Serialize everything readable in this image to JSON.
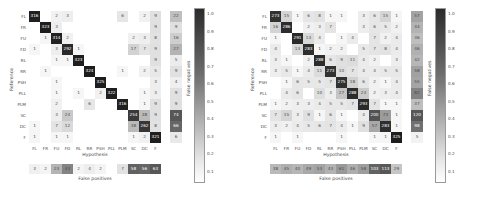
{
  "figure": {
    "panel_count": 2,
    "axis_labels": {
      "x": "Hypothesis",
      "y": "Reference",
      "false_negatives": "False negatives",
      "false_positives": "False positives"
    },
    "colorbar": {
      "ticks": [
        "1.0",
        "0.9",
        "0.8",
        "0.7",
        "0.6",
        "0.5",
        "0.4",
        "0.3",
        "0.2",
        "0.1"
      ],
      "vmin": 0.1,
      "vmax": 1.0,
      "colormap": "greys",
      "low_color": "#ffffff",
      "high_color": "#2b2b2b"
    }
  },
  "chart_data": [
    {
      "type": "heatmap",
      "title": "",
      "panel": "left",
      "xlabel": "Hypothesis",
      "ylabel": "Reference",
      "categories": [
        "FL",
        "FR",
        "FU",
        "FD",
        "RL",
        "RR",
        "PSH",
        "PLL",
        "PLM",
        "SC",
        "DC",
        "F"
      ],
      "row_labels": [
        "FL",
        "FR",
        "FU",
        "FD",
        "RL",
        "RR",
        "PSH",
        "PLL",
        "PLM",
        "SC",
        "DC",
        "F"
      ],
      "col_labels": [
        "FL",
        "FR",
        "FU",
        "FD",
        "RL",
        "RR",
        "PSH",
        "PLL",
        "PLM",
        "SC",
        "DC",
        "F"
      ],
      "values": [
        [
          316,
          0,
          2,
          3,
          0,
          0,
          0,
          0,
          6,
          0,
          2,
          9
        ],
        [
          0,
          323,
          3,
          0,
          0,
          0,
          0,
          0,
          0,
          0,
          0,
          9
        ],
        [
          0,
          1,
          314,
          2,
          0,
          0,
          0,
          0,
          0,
          2,
          3,
          8
        ],
        [
          1,
          0,
          3,
          292,
          1,
          0,
          0,
          0,
          0,
          17,
          7,
          9
        ],
        [
          0,
          0,
          1,
          1,
          323,
          0,
          0,
          0,
          0,
          0,
          0,
          9
        ],
        [
          0,
          1,
          0,
          0,
          0,
          324,
          0,
          0,
          1,
          0,
          2,
          5
        ],
        [
          0,
          0,
          1,
          0,
          0,
          0,
          325,
          0,
          0,
          0,
          0,
          3
        ],
        [
          0,
          0,
          1,
          0,
          1,
          0,
          2,
          322,
          0,
          0,
          1,
          3
        ],
        [
          0,
          0,
          2,
          0,
          0,
          6,
          0,
          0,
          316,
          0,
          1,
          9
        ],
        [
          0,
          0,
          3,
          24,
          0,
          0,
          0,
          0,
          0,
          254,
          38,
          9
        ],
        [
          1,
          0,
          7,
          12,
          0,
          0,
          0,
          0,
          0,
          38,
          262,
          8
        ],
        [
          1,
          0,
          1,
          1,
          0,
          0,
          0,
          0,
          0,
          1,
          2,
          321
        ]
      ],
      "false_negatives": [
        22,
        9,
        16,
        27,
        5,
        9,
        4,
        9,
        9,
        74,
        66,
        6
      ],
      "false_positives": [
        3,
        2,
        23,
        43,
        2,
        4,
        2,
        0,
        7,
        58,
        56,
        63
      ],
      "grid": true,
      "legend": "colorbar-right",
      "clim": [
        0.1,
        1.0
      ]
    },
    {
      "type": "heatmap",
      "title": "",
      "panel": "right",
      "xlabel": "Hypothesis",
      "ylabel": "Reference",
      "categories": [
        "FL",
        "FR",
        "FU",
        "FD",
        "RL",
        "RR",
        "PSH",
        "PLL",
        "PLM",
        "SC",
        "DC",
        "F"
      ],
      "row_labels": [
        "FL",
        "FR",
        "FU",
        "FD",
        "RL",
        "RR",
        "PSH",
        "PLL",
        "PLM",
        "SC",
        "DC",
        "F"
      ],
      "col_labels": [
        "FL",
        "FR",
        "FU",
        "FD",
        "RL",
        "RR",
        "PSH",
        "PLL",
        "PLM",
        "SC",
        "DC",
        "F"
      ],
      "values": [
        [
          273,
          15,
          1,
          6,
          8,
          1,
          1,
          0,
          3,
          6,
          15,
          1
        ],
        [
          16,
          286,
          0,
          2,
          3,
          7,
          0,
          0,
          3,
          6,
          5,
          2
        ],
        [
          1,
          0,
          291,
          13,
          4,
          0,
          1,
          4,
          0,
          7,
          2,
          4
        ],
        [
          4,
          0,
          13,
          283,
          1,
          2,
          2,
          0,
          5,
          7,
          8,
          4
        ],
        [
          3,
          1,
          0,
          2,
          288,
          6,
          9,
          11,
          4,
          2,
          0,
          3
        ],
        [
          3,
          5,
          1,
          4,
          11,
          273,
          10,
          7,
          4,
          4,
          5,
          5
        ],
        [
          0,
          1,
          6,
          5,
          5,
          7,
          275,
          18,
          6,
          2,
          1,
          4
        ],
        [
          0,
          4,
          6,
          0,
          10,
          3,
          27,
          288,
          23,
          2,
          3,
          4
        ],
        [
          1,
          2,
          3,
          3,
          4,
          5,
          5,
          7,
          293,
          7,
          1,
          1
        ],
        [
          7,
          15,
          3,
          9,
          1,
          6,
          1,
          0,
          4,
          200,
          73,
          1
        ],
        [
          3,
          2,
          4,
          5,
          6,
          7,
          4,
          1,
          9,
          57,
          283,
          1
        ],
        [
          1,
          0,
          1,
          0,
          0,
          0,
          1,
          0,
          0,
          1,
          1,
          325
        ]
      ],
      "false_negatives": [
        57,
        44,
        36,
        46,
        42,
        58,
        55,
        82,
        37,
        120,
        98,
        5
      ],
      "false_positives": [
        38,
        45,
        40,
        49,
        53,
        43,
        61,
        46,
        58,
        103,
        113,
        29
      ],
      "grid": true,
      "legend": "colorbar-right",
      "clim": [
        0.1,
        1.0
      ]
    }
  ]
}
